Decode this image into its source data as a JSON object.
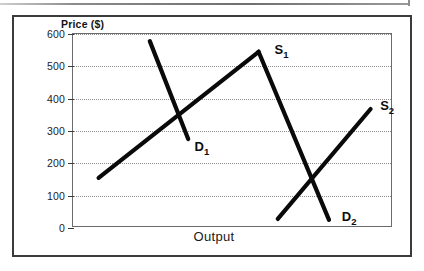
{
  "figure": {
    "kind": "supply-demand-line-chart",
    "background_color": "#ffffff",
    "line_color": "#0a0a0a",
    "frame_color": "#3b3b3b",
    "grid_color": "#8d8d8d"
  },
  "chart_data": {
    "type": "line",
    "title": "",
    "xlabel": "Output",
    "ylabel": "Price ($)",
    "ylim": [
      0,
      600
    ],
    "ytick_labels": [
      "600",
      "500",
      "400",
      "300",
      "200",
      "100",
      "0"
    ],
    "yticks": [
      600,
      500,
      400,
      300,
      200,
      100,
      0
    ],
    "xtick_labels": [],
    "grid": "horizontal-dotted",
    "legend": "inline-curve-labels",
    "series": [
      {
        "name": "S1",
        "label": "S",
        "subscript": "1",
        "role": "supply",
        "slope": "upward",
        "x": [
          8,
          58
        ],
        "y": [
          155,
          545
        ],
        "label_pos": {
          "x": 63,
          "y": 550
        }
      },
      {
        "name": "D1",
        "label": "D",
        "subscript": "1",
        "role": "demand",
        "slope": "downward",
        "x": [
          24,
          36
        ],
        "y": [
          578,
          275
        ],
        "label_pos": {
          "x": 38,
          "y": 250
        }
      },
      {
        "name": "S2",
        "label": "S",
        "subscript": "2",
        "role": "supply",
        "slope": "upward",
        "x": [
          64,
          93
        ],
        "y": [
          28,
          368
        ],
        "label_pos": {
          "x": 96,
          "y": 378
        }
      },
      {
        "name": "D2",
        "label": "D",
        "subscript": "2",
        "role": "demand",
        "slope": "downward",
        "x": [
          58,
          80
        ],
        "y": [
          545,
          25
        ],
        "label_pos": {
          "x": 84,
          "y": 35
        }
      }
    ],
    "annotations": [
      {
        "text": "S",
        "sub": "1"
      },
      {
        "text": "D",
        "sub": "1"
      },
      {
        "text": "S",
        "sub": "2"
      },
      {
        "text": "D",
        "sub": "2"
      }
    ]
  }
}
